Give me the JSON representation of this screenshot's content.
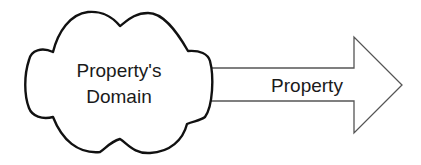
{
  "diagram": {
    "cloud": {
      "line1": "Property's",
      "line2": "Domain",
      "stroke": "#111111",
      "fill": "#ffffff"
    },
    "arrow": {
      "label": "Property",
      "stroke": "#555555",
      "fill": "#ffffff"
    }
  }
}
